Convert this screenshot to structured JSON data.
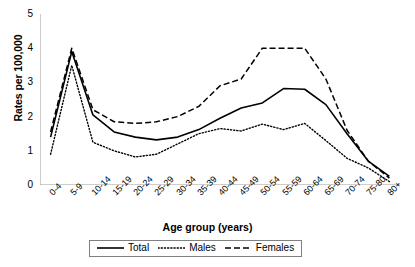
{
  "chart_data": {
    "type": "line",
    "title": "",
    "xlabel": "Age group (years)",
    "ylabel": "Rates per 100,000",
    "categories": [
      "0-4",
      "5-9",
      "10-14",
      "15-19",
      "20-24",
      "25-29",
      "30-34",
      "35-39",
      "40-44",
      "45-49",
      "50-54",
      "55-59",
      "60-64",
      "65-69",
      "70-74",
      "75-80",
      "80+"
    ],
    "ylim": [
      0,
      5
    ],
    "yticks": [
      0,
      1,
      2,
      3,
      4,
      5
    ],
    "grid": false,
    "legend_position": "bottom-center",
    "series": [
      {
        "name": "Total",
        "style": "solid",
        "color": "#000000",
        "values": [
          1.4,
          3.9,
          2.05,
          1.55,
          1.4,
          1.32,
          1.4,
          1.62,
          1.95,
          2.25,
          2.4,
          2.82,
          2.8,
          2.35,
          1.5,
          0.7,
          0.25
        ]
      },
      {
        "name": "Males",
        "style": "dotted",
        "color": "#000000",
        "values": [
          0.9,
          3.5,
          1.25,
          1.0,
          0.82,
          0.9,
          1.2,
          1.5,
          1.65,
          1.58,
          1.78,
          1.62,
          1.8,
          1.3,
          0.78,
          0.5,
          0.1
        ]
      },
      {
        "name": "Females",
        "style": "dashed",
        "color": "#000000",
        "values": [
          1.55,
          4.0,
          2.2,
          1.85,
          1.8,
          1.85,
          2.0,
          2.3,
          2.9,
          3.1,
          4.0,
          4.0,
          4.0,
          3.1,
          1.6,
          0.7,
          0.2
        ]
      }
    ]
  },
  "legend": {
    "items": [
      {
        "label": "Total"
      },
      {
        "label": "Males"
      },
      {
        "label": "Females"
      }
    ]
  },
  "axis": {
    "y_title": "Rates per 100,000",
    "x_title": "Age group (years)"
  }
}
